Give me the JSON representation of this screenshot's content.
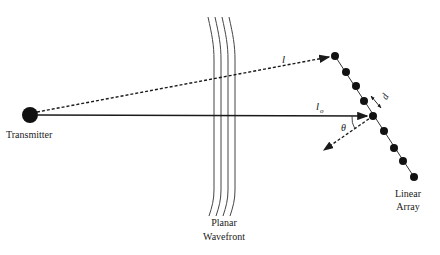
{
  "diagram": {
    "title": "",
    "labels": {
      "transmitter": "Transmitter",
      "wavefront_line1": "Planar",
      "wavefront_line2": "Wavefront",
      "array_line1": "Linear",
      "array_line2": "Array",
      "path_l": "l",
      "path_lo": "l",
      "path_lo_sub": "o",
      "angle": "θ",
      "spacing": "d"
    },
    "nodes": {
      "transmitter": {
        "x": 30,
        "y": 115,
        "r": 8
      },
      "array_elements": [
        {
          "x": 335,
          "y": 56
        },
        {
          "x": 346,
          "y": 72
        },
        {
          "x": 356,
          "y": 86
        },
        {
          "x": 364,
          "y": 101
        },
        {
          "x": 373,
          "y": 116
        },
        {
          "x": 384,
          "y": 131
        },
        {
          "x": 394,
          "y": 148
        },
        {
          "x": 403,
          "y": 161
        },
        {
          "x": 414,
          "y": 177
        }
      ]
    },
    "colors": {
      "ink": "#1a1a1a",
      "background": "#ffffff"
    }
  }
}
